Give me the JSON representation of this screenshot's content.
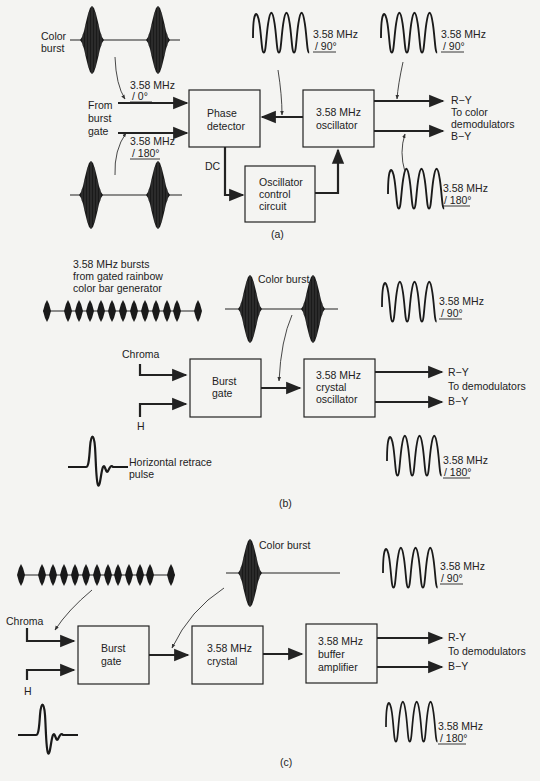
{
  "figure": {
    "panels": [
      {
        "id": "a",
        "caption": "(a)",
        "blocks": {
          "phase_detector": [
            "Phase",
            "detector"
          ],
          "oscillator": [
            "3.58 MHz",
            "oscillator"
          ],
          "control": [
            "Oscillator",
            "control",
            "circuit"
          ]
        },
        "labels": {
          "color_burst": [
            "Color",
            "burst"
          ],
          "from_gate": [
            "From",
            "burst",
            "gate"
          ],
          "in_top_freq": "3.58 MHz",
          "in_top_phase": "/ 0°",
          "in_bot_freq": "3.58 MHz",
          "in_bot_phase": "/ 180°",
          "dc": "DC",
          "fb_freq": "3.58 MHz",
          "fb_phase": "/ 90°",
          "out_r_freq": "3.58 MHz",
          "out_r_phase": "/ 90°",
          "out_b_freq": "3.58 MHz",
          "out_b_phase": "/ 180°",
          "r_y": "R−Y",
          "to_dem": [
            "To color",
            "demodulators"
          ],
          "b_y": "B−Y"
        }
      },
      {
        "id": "b",
        "caption": "(b)",
        "blocks": {
          "burst_gate": [
            "Burst",
            "gate"
          ],
          "crystal_osc": [
            "3.58 MHz",
            "crystal",
            "oscillator"
          ]
        },
        "labels": {
          "rainbow": [
            "3.58 MHz bursts",
            "from gated rainbow",
            "color bar generator"
          ],
          "color_burst": "Color burst",
          "chroma": "Chroma",
          "h": "H",
          "h_pulse": [
            "Horizontal retrace",
            "pulse"
          ],
          "top_freq": "3.58 MHz",
          "top_phase": "/ 90°",
          "bot_freq": "3.58 MHz",
          "bot_phase": "/ 180°",
          "r_y": "R−Y",
          "to_dem": "To demodulators",
          "b_y": "B−Y"
        }
      },
      {
        "id": "c",
        "caption": "(c)",
        "blocks": {
          "burst_gate": [
            "Burst",
            "gate"
          ],
          "crystal": [
            "3.58 MHz",
            "crystal"
          ],
          "buffer": [
            "3.58 MHz",
            "buffer",
            "amplifier"
          ]
        },
        "labels": {
          "color_burst": "Color burst",
          "chroma": "Chroma",
          "h": "H",
          "top_freq": "3.58 MHz",
          "top_phase": "/ 90°",
          "bot_freq": "3.58 MHz",
          "bot_phase": "/ 180°",
          "r_y": "R-Y",
          "to_dem": "To demodulators",
          "b_y": "B−Y"
        }
      }
    ]
  }
}
